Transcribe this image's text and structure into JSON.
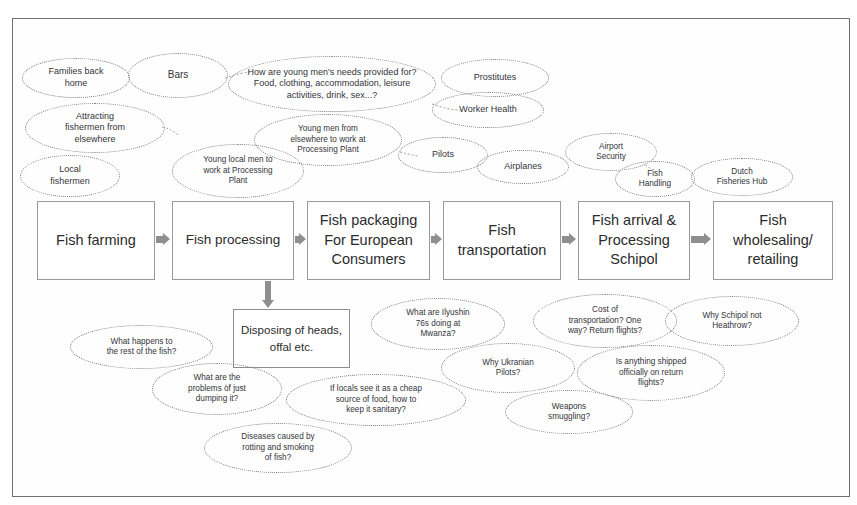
{
  "diagram": {
    "frame_color": "#6f6f6f",
    "box_border_color": "#9a9a9a",
    "bubble_border_color": "#7d7d7d",
    "arrow_color": "#8e8e8e",
    "text_color": "#2b2b2b"
  },
  "process_boxes": [
    {
      "id": "fish-farming",
      "label": "Fish farming"
    },
    {
      "id": "fish-processing",
      "label": "Fish processing"
    },
    {
      "id": "fish-packaging",
      "label": "Fish packaging For European Consumers",
      "lines": [
        "Fish packaging",
        "For European",
        "Consumers"
      ]
    },
    {
      "id": "fish-transportation",
      "label": "Fish transportation",
      "lines": [
        "Fish",
        "transportation"
      ]
    },
    {
      "id": "fish-arrival",
      "label": "Fish arrival & Processing Schipol",
      "lines": [
        "Fish arrival &",
        "Processing",
        "Schipol"
      ]
    },
    {
      "id": "fish-wholesaling",
      "label": "Fish wholesaling/ retailing",
      "lines": [
        "Fish",
        "wholesaling/",
        "retailing"
      ]
    }
  ],
  "sub_boxes": [
    {
      "id": "disposing",
      "label": "Disposing of heads, offal etc.",
      "lines": [
        "Disposing of heads,",
        "offal etc."
      ]
    }
  ],
  "bubbles_top": [
    {
      "id": "families-back-home",
      "lines": [
        "Families back",
        "home"
      ]
    },
    {
      "id": "bars",
      "lines": [
        "Bars"
      ]
    },
    {
      "id": "young-mens-needs",
      "lines": [
        "How are young men's needs provided for?",
        "Food, clothing, accommodation, leisure",
        "activities, drink, sex...?"
      ]
    },
    {
      "id": "prostitutes",
      "lines": [
        "Prostitutes"
      ]
    },
    {
      "id": "worker-health",
      "lines": [
        "Worker Health"
      ]
    },
    {
      "id": "attracting-fishermen",
      "lines": [
        "Attracting",
        "fishermen from",
        "elsewhere"
      ]
    },
    {
      "id": "local-fishermen",
      "lines": [
        "Local",
        "fishermen"
      ]
    },
    {
      "id": "young-local-men",
      "lines": [
        "Young local men to",
        "work at Processing",
        "Plant"
      ]
    },
    {
      "id": "young-men-elsewhere",
      "lines": [
        "Young men from",
        "elsewhere to work at",
        "Processing Plant"
      ]
    },
    {
      "id": "pilots",
      "lines": [
        "Pilots"
      ]
    },
    {
      "id": "airplanes",
      "lines": [
        "Airplanes"
      ]
    },
    {
      "id": "airport-security",
      "lines": [
        "Airport",
        "Security"
      ]
    },
    {
      "id": "fish-handling",
      "lines": [
        "Fish",
        "Handling"
      ]
    },
    {
      "id": "dutch-fisheries-hub",
      "lines": [
        "Dutch",
        "Fisheries Hub"
      ]
    }
  ],
  "bubbles_bottom": [
    {
      "id": "what-happens-rest",
      "lines": [
        "What happens to",
        "the rest of the fish?"
      ]
    },
    {
      "id": "problems-dumping",
      "lines": [
        "What are the",
        "problems of just",
        "dumping it?"
      ]
    },
    {
      "id": "cheap-source-food",
      "lines": [
        "If locals see it as a cheap",
        "source of food, how to",
        "keep it sanitary?"
      ]
    },
    {
      "id": "diseases-rotting",
      "lines": [
        "Diseases caused by",
        "rotting and smoking",
        "of fish?"
      ]
    },
    {
      "id": "ilyushin-76s",
      "lines": [
        "What are Ilyushin",
        "76s doing at",
        "Mwanza?"
      ]
    },
    {
      "id": "ukranian-pilots",
      "lines": [
        "Why Ukranian",
        "Pilots?"
      ]
    },
    {
      "id": "cost-of-transportation",
      "lines": [
        "Cost of",
        "transportation?  One",
        "way? Return flights?"
      ]
    },
    {
      "id": "schipol-not-heathrow",
      "lines": [
        "Why Schipol not",
        "Heathrow?"
      ]
    },
    {
      "id": "anything-shipped",
      "lines": [
        "Is anything shipped",
        "officially on return",
        "flights?"
      ]
    },
    {
      "id": "weapons-smuggling",
      "lines": [
        "Weapons",
        "smuggling?"
      ]
    }
  ]
}
